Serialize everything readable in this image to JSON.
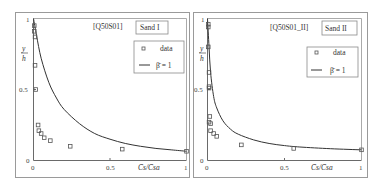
{
  "chart_data": [
    {
      "type": "scatter",
      "title": "[Q50S01]",
      "panel_label": "Sand I",
      "xlabel": "C̄s^m / C̄sa^m",
      "ylabel": "y/h",
      "xlim": [
        0,
        1
      ],
      "ylim": [
        0,
        1
      ],
      "xticks": [
        "0",
        "0.5",
        "1"
      ],
      "yticks": [
        "0",
        "0.5",
        "1"
      ],
      "legend": {
        "position": "upper right",
        "entries": [
          "data",
          "β̄ = 1"
        ]
      },
      "series": [
        {
          "name": "data",
          "kind": "markers",
          "x": [
            0.005,
            0.005,
            0.01,
            0.01,
            0.015,
            0.03,
            0.035,
            0.05,
            0.07,
            0.11,
            0.24,
            0.58,
            1.0
          ],
          "y": [
            0.95,
            0.91,
            0.87,
            0.67,
            0.5,
            0.25,
            0.21,
            0.19,
            0.16,
            0.14,
            0.1,
            0.08,
            0.065
          ]
        },
        {
          "name": "β̄ = 1",
          "kind": "line",
          "x": [
            0.0,
            0.02,
            0.05,
            0.1,
            0.15,
            0.2,
            0.3,
            0.4,
            0.5,
            0.6,
            0.7,
            0.8,
            0.9,
            1.0
          ],
          "y": [
            1.0,
            0.88,
            0.72,
            0.55,
            0.44,
            0.36,
            0.26,
            0.19,
            0.15,
            0.12,
            0.1,
            0.085,
            0.075,
            0.065
          ]
        }
      ]
    },
    {
      "type": "scatter",
      "title": "[Q50S01_II]",
      "panel_label": "Sand II",
      "xlabel": "C̄s^m / C̄sa^m",
      "ylabel": "y/h",
      "xlim": [
        0,
        1
      ],
      "ylim": [
        0,
        1
      ],
      "xticks": [
        "0",
        "0.5",
        "1"
      ],
      "yticks": [
        "0",
        "0.5",
        "1"
      ],
      "legend": {
        "position": "upper right",
        "entries": [
          "data",
          "β̄ = 1"
        ]
      },
      "series": [
        {
          "name": "data",
          "kind": "markers",
          "x": [
            0.005,
            0.005,
            0.005,
            0.01,
            0.01,
            0.01,
            0.015,
            0.01,
            0.02,
            0.02,
            0.04,
            0.06,
            0.22,
            0.56,
            1.0
          ],
          "y": [
            0.96,
            0.94,
            0.8,
            0.62,
            0.52,
            0.51,
            0.31,
            0.27,
            0.26,
            0.21,
            0.19,
            0.17,
            0.11,
            0.085,
            0.075
          ]
        },
        {
          "name": "β̄ = 1",
          "kind": "line",
          "x": [
            0.0,
            0.01,
            0.02,
            0.04,
            0.06,
            0.1,
            0.15,
            0.2,
            0.3,
            0.4,
            0.5,
            0.6,
            0.8,
            1.0
          ],
          "y": [
            1.0,
            0.8,
            0.62,
            0.45,
            0.37,
            0.28,
            0.22,
            0.185,
            0.145,
            0.12,
            0.105,
            0.095,
            0.083,
            0.075
          ]
        }
      ]
    }
  ],
  "panels": [
    {
      "id": "[Q50S01]",
      "sand": "Sand I",
      "legend_data": "data",
      "legend_curve": "β̄ = 1",
      "tick_x0": "0",
      "tick_x05": "0.5",
      "tick_x1": "1",
      "tick_y0": "0",
      "tick_y05": "0.5",
      "tick_y1": "1",
      "ylabel_num": "y",
      "ylabel_den": "h",
      "xlabel": "C̄s/C̄sa"
    },
    {
      "id": "[Q50S01_II]",
      "sand": "Sand II",
      "legend_data": "data",
      "legend_curve": "β̄ = 1",
      "tick_x0": "0",
      "tick_x05": "0.5",
      "tick_x1": "1",
      "tick_y0": "0",
      "tick_y05": "0.5",
      "tick_y1": "1",
      "ylabel_num": "y",
      "ylabel_den": "h",
      "xlabel": "C̄s/C̄sa"
    }
  ]
}
